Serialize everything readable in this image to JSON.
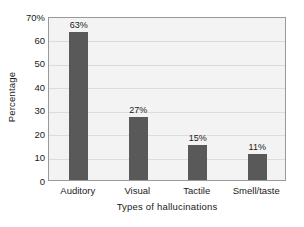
{
  "chart_data": {
    "type": "bar",
    "title": "",
    "xlabel": "Types of hallucinations",
    "ylabel": "Percentage",
    "categories": [
      "Auditory",
      "Visual",
      "Tactile",
      "Smell/taste"
    ],
    "values": [
      63,
      27,
      15,
      11
    ],
    "data_labels": [
      "63%",
      "27%",
      "15%",
      "11%"
    ],
    "ylim": [
      0,
      70
    ],
    "ytick_values": [
      0,
      10,
      20,
      30,
      40,
      50,
      60,
      70
    ],
    "ytick_labels": [
      "0",
      "10",
      "20",
      "30",
      "40",
      "50",
      "60",
      "70%"
    ],
    "grid": true,
    "legend": false,
    "series": [
      {
        "name": "Percentage",
        "values": [
          63,
          27,
          15,
          11
        ]
      }
    ],
    "colors": {
      "bar": "#595959",
      "plot_background": "#f3f3f3",
      "gridline": "#dcdcdc",
      "frame": "#9a9a9a",
      "text": "#1a1a1a",
      "figure_background": "#ffffff"
    }
  }
}
